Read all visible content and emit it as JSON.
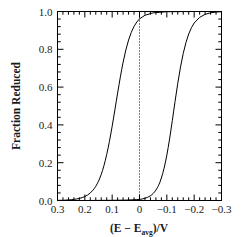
{
  "chart_data": {
    "type": "line",
    "title": "",
    "xlabel": "(E − E_avg)/V",
    "xlabel_parts": {
      "prefix": "(E − E",
      "subscript": "avg",
      "suffix": ")/V"
    },
    "ylabel": "Fraction Reduced",
    "xlim": [
      0.3,
      -0.3
    ],
    "ylim": [
      0.0,
      1.0
    ],
    "x_reversed": true,
    "grid": false,
    "legend": null,
    "x_ticks": [
      "0.3",
      "0.2",
      "0.1",
      "0",
      "-0.1",
      "-0.2",
      "-0.3"
    ],
    "x_tick_values": [
      0.3,
      0.2,
      0.1,
      0.0,
      -0.1,
      -0.2,
      -0.3
    ],
    "x_minor_per_major": 5,
    "y_ticks": [
      "0.0",
      "0.2",
      "0.4",
      "0.6",
      "0.8",
      "1.0"
    ],
    "y_tick_values": [
      0.0,
      0.2,
      0.4,
      0.6,
      0.8,
      1.0
    ],
    "y_minor_per_major": 5,
    "annotations": [
      {
        "name": "zero-reference-line",
        "type": "vline",
        "x": 0.0,
        "style": "dotted",
        "color": "#000000"
      }
    ],
    "series": [
      {
        "name": "left-sigmoid-curve",
        "color": "#000000",
        "linewidth": 1.0,
        "description": "Nernstian reduction wave, midpoint near E-Eavg = +0.115 V",
        "midpoint": 0.115,
        "slope_mV": 26,
        "x": [
          0.3,
          0.28,
          0.26,
          0.25,
          0.24,
          0.23,
          0.22,
          0.21,
          0.2,
          0.19,
          0.18,
          0.17,
          0.165,
          0.16,
          0.155,
          0.15,
          0.145,
          0.14,
          0.135,
          0.13,
          0.125,
          0.12,
          0.115,
          0.11,
          0.105,
          0.1,
          0.095,
          0.09,
          0.085,
          0.08,
          0.075,
          0.07,
          0.065,
          0.06,
          0.05,
          0.04,
          0.03,
          0.02,
          0.01,
          0.0,
          -0.02,
          -0.05,
          -0.1,
          -0.2,
          -0.3
        ],
        "y": [
          0.001,
          0.001,
          0.003,
          0.004,
          0.006,
          0.008,
          0.011,
          0.015,
          0.021,
          0.029,
          0.04,
          0.055,
          0.064,
          0.075,
          0.088,
          0.102,
          0.119,
          0.138,
          0.16,
          0.185,
          0.213,
          0.243,
          0.277,
          0.313,
          0.352,
          0.393,
          0.436,
          0.48,
          0.525,
          0.569,
          0.612,
          0.654,
          0.694,
          0.731,
          0.796,
          0.849,
          0.89,
          0.921,
          0.944,
          0.961,
          0.98,
          0.993,
          0.999,
          1.0,
          1.0
        ]
      },
      {
        "name": "right-sigmoid-curve",
        "color": "#000000",
        "linewidth": 1.0,
        "description": "Nernstian reduction wave, midpoint near E-Eavg = -0.093 V",
        "midpoint": -0.093,
        "slope_mV": 26,
        "x": [
          0.3,
          0.2,
          0.1,
          0.05,
          0.02,
          0.01,
          0.0,
          -0.01,
          -0.02,
          -0.03,
          -0.04,
          -0.045,
          -0.05,
          -0.055,
          -0.06,
          -0.065,
          -0.07,
          -0.075,
          -0.08,
          -0.085,
          -0.09,
          -0.095,
          -0.1,
          -0.105,
          -0.11,
          -0.115,
          -0.12,
          -0.125,
          -0.13,
          -0.14,
          -0.15,
          -0.16,
          -0.17,
          -0.18,
          -0.19,
          -0.2,
          -0.22,
          -0.24,
          -0.26,
          -0.28,
          -0.3
        ],
        "y": [
          0.0,
          0.0,
          0.001,
          0.002,
          0.004,
          0.005,
          0.006,
          0.008,
          0.012,
          0.017,
          0.025,
          0.03,
          0.037,
          0.045,
          0.055,
          0.067,
          0.081,
          0.098,
          0.119,
          0.143,
          0.171,
          0.204,
          0.24,
          0.281,
          0.325,
          0.373,
          0.422,
          0.473,
          0.523,
          0.62,
          0.706,
          0.778,
          0.836,
          0.881,
          0.914,
          0.939,
          0.969,
          0.985,
          0.993,
          0.997,
          0.999
        ]
      }
    ]
  },
  "figure": {
    "background_color": "#ffffff",
    "frame_color": "#000000",
    "text_color": "#1a1a1a"
  }
}
